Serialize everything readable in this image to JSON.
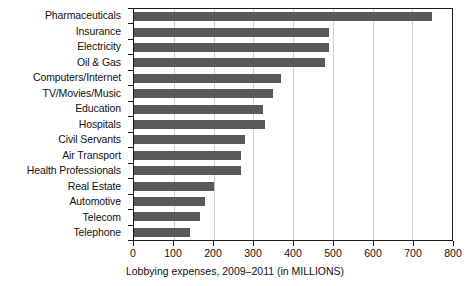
{
  "chart_data": {
    "type": "bar",
    "orientation": "horizontal",
    "title": "",
    "xlabel": "Lobbying expenses, 2009–2011 (in MILLIONS)",
    "ylabel": "",
    "xlim": [
      0,
      800
    ],
    "xticks": [
      0,
      100,
      200,
      300,
      400,
      500,
      600,
      700,
      800
    ],
    "xtick_labels": [
      "0",
      "100",
      "200",
      "300",
      "400",
      "500",
      "600",
      "700",
      "800"
    ],
    "grid": "vertical",
    "legend": "none",
    "bar_color": "#595959",
    "categories": [
      "Pharmaceuticals",
      "Insurance",
      "Electricity",
      "Oil & Gas",
      "Computers/Internet",
      "TV/Movies/Music",
      "Education",
      "Hospitals",
      "Civil Servants",
      "Air Transport",
      "Health Professionals",
      "Real Estate",
      "Automotive",
      "Telecom",
      "Telephone"
    ],
    "values": [
      750,
      490,
      490,
      480,
      370,
      350,
      325,
      330,
      280,
      270,
      270,
      200,
      178,
      166,
      140
    ]
  }
}
